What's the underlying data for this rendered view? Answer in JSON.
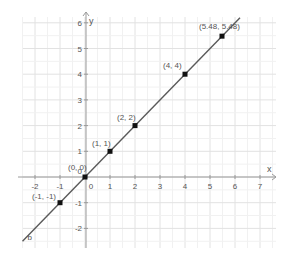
{
  "chart_data": {
    "type": "line",
    "title": "",
    "xlabel": "x",
    "ylabel": "y",
    "xlim": [
      -2.6,
      7.9
    ],
    "ylim": [
      -2.5,
      6.3
    ],
    "grid": true,
    "x_ticks": [
      "-2",
      "-1",
      "0",
      "1",
      "2",
      "3",
      "4",
      "5",
      "6",
      "7"
    ],
    "y_ticks": [
      "-2",
      "-1",
      "0",
      "1",
      "2",
      "3",
      "4",
      "5",
      "6"
    ],
    "line": {
      "name": "b",
      "equation": "y = x"
    },
    "points": [
      {
        "x": -1,
        "y": -1,
        "label": "(-1, -1)"
      },
      {
        "x": 0,
        "y": 0,
        "label": "(0, 0)"
      },
      {
        "x": 1,
        "y": 1,
        "label": "(1, 1)"
      },
      {
        "x": 2,
        "y": 2,
        "label": "(2, 2)"
      },
      {
        "x": 4,
        "y": 4,
        "label": "(4, 4)"
      },
      {
        "x": 5.48,
        "y": 5.48,
        "label": "(5.48, 5.48)"
      }
    ],
    "colors": {
      "line": "#5a5a5a",
      "point": "#111111",
      "grid": "#e6e6e6",
      "axis": "#9a9a9a",
      "text": "#555555"
    }
  }
}
